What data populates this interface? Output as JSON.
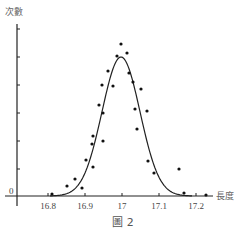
{
  "chart_data": {
    "type": "scatter",
    "title": "",
    "caption": "圖 2",
    "xlabel": "長度",
    "ylabel": "次數",
    "x_ticks": [
      "16.8",
      "16.9",
      "17",
      "17.1",
      "17.2"
    ],
    "y_ticks": [
      "0"
    ],
    "xlim": [
      16.72,
      17.25
    ],
    "ylim": [
      0,
      1
    ],
    "grid": false,
    "legend": null,
    "series": [
      {
        "name": "observations",
        "kind": "scatter",
        "points_px": [
          [
            121,
            44
          ],
          [
            127,
            53
          ],
          [
            117,
            56
          ],
          [
            108,
            71
          ],
          [
            129,
            73
          ],
          [
            102,
            85
          ],
          [
            113,
            86
          ],
          [
            133,
            82
          ],
          [
            141,
            89
          ],
          [
            99,
            105
          ],
          [
            103,
            113
          ],
          [
            135,
            109
          ],
          [
            147,
            111
          ],
          [
            93,
            136
          ],
          [
            92,
            144
          ],
          [
            103,
            141
          ],
          [
            137,
            129
          ],
          [
            86,
            160
          ],
          [
            93,
            167
          ],
          [
            75,
            179
          ],
          [
            67,
            186
          ],
          [
            82,
            188
          ],
          [
            52,
            194
          ],
          [
            148,
            161
          ],
          [
            154,
            173
          ],
          [
            179,
            169
          ],
          [
            184,
            193
          ],
          [
            206,
            195
          ]
        ]
      },
      {
        "name": "normal-curve",
        "kind": "line",
        "mean": 17.0,
        "peak_px": [
          121,
          57
        ]
      }
    ]
  },
  "labels": {
    "y_axis_title": "次數",
    "x_axis_title": "長度",
    "origin": "0",
    "caption": "圖 2",
    "x_ticks": [
      "16.8",
      "16.9",
      "17",
      "17.1",
      "17.2"
    ]
  }
}
